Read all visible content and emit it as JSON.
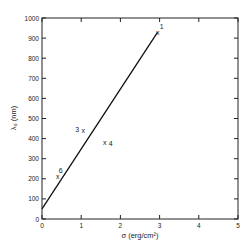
{
  "chart_data": {
    "type": "scatter",
    "title": "",
    "xlabel": "σ (erg/cm²)",
    "ylabel": "λ₀ (nm)",
    "xlim": [
      0,
      5
    ],
    "ylim": [
      0,
      1000
    ],
    "xticks": [
      "0",
      "1",
      "2",
      "3",
      "4",
      "5"
    ],
    "yticks": [
      "0",
      "100",
      "200",
      "300",
      "400",
      "500",
      "600",
      "700",
      "800",
      "900",
      "1000"
    ],
    "grid": false,
    "points": [
      {
        "label": "1",
        "x": 2.95,
        "y": 930
      },
      {
        "label": "3",
        "x": 1.05,
        "y": 440
      },
      {
        "label": "4",
        "x": 1.6,
        "y": 380
      },
      {
        "label": "6",
        "x": 0.4,
        "y": 210
      }
    ],
    "fit_line": {
      "x": [
        0,
        2.95
      ],
      "y": [
        50,
        930
      ]
    }
  }
}
